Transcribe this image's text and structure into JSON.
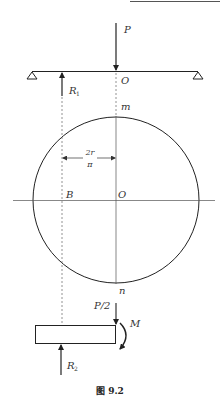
{
  "figure": {
    "caption": "图 9.2",
    "labels": {
      "load": "P",
      "reaction_1": "R",
      "reaction_1_sub": "1",
      "beam_center": "O",
      "top_point": "m",
      "distance_numerator": "2r",
      "distance_denominator": "π",
      "point_b": "B",
      "circle_center": "O",
      "bottom_point": "n",
      "half_load": "P/2",
      "moment": "M",
      "reaction_2": "R",
      "reaction_2_sub": "2"
    },
    "colors": {
      "line": "#333333",
      "dashed": "#666666"
    }
  }
}
